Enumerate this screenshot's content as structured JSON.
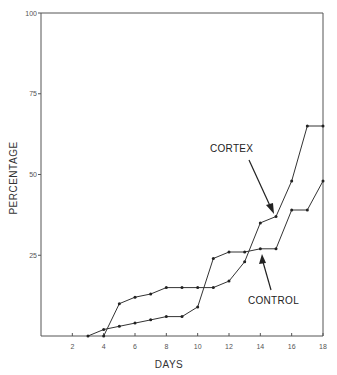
{
  "chart_data": {
    "type": "line",
    "title": "",
    "xlabel": "DAYS",
    "ylabel": "PERCENTAGE",
    "xlim": [
      0,
      18
    ],
    "ylim": [
      0,
      100
    ],
    "x_ticks": [
      2,
      4,
      6,
      8,
      10,
      12,
      14,
      16,
      18
    ],
    "y_ticks": [
      25,
      50,
      75,
      100
    ],
    "grid": false,
    "legend": "inline annotations with arrows",
    "series": [
      {
        "name": "CORTEX",
        "x": [
          4,
          5,
          6,
          7,
          8,
          9,
          10,
          11,
          12,
          13,
          14,
          15,
          16,
          17,
          18
        ],
        "values": [
          0,
          10,
          12,
          13,
          15,
          15,
          15,
          15,
          17,
          23,
          35,
          37,
          48,
          65,
          65
        ]
      },
      {
        "name": "CONTROL",
        "x": [
          3,
          4,
          5,
          6,
          7,
          8,
          9,
          10,
          11,
          12,
          13,
          14,
          15,
          16,
          17,
          18
        ],
        "values": [
          0,
          2,
          3,
          4,
          5,
          6,
          6,
          9,
          24,
          26,
          26,
          27,
          27,
          39,
          39,
          48
        ]
      }
    ],
    "annotations": [
      {
        "text": "CORTEX",
        "points_to": {
          "series": "CORTEX",
          "x": 15
        }
      },
      {
        "text": "CONTROL",
        "points_to": {
          "series": "CONTROL",
          "x": 14
        }
      }
    ]
  }
}
